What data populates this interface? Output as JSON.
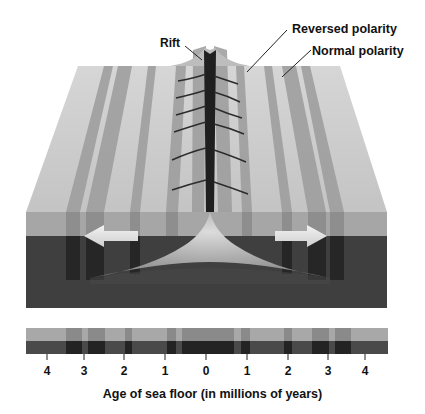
{
  "labels": {
    "rift": "Rift",
    "reversed": "Reversed polarity",
    "normal": "Normal polarity"
  },
  "axis": {
    "title": "Age of sea floor (in millions of years)",
    "ticks": [
      "4",
      "3",
      "2",
      "1",
      "0",
      "1",
      "2",
      "3",
      "4"
    ]
  },
  "colors": {
    "normal_top": "#c9c9c9",
    "reversed_top": "#9a9a9a",
    "normal_front": "#a7a7a7",
    "reversed_front": "#8c8c8c",
    "dark_base": "#3d3d3d",
    "darker_stripe": "#2a2a2a",
    "magma": "#b8b8b8",
    "arrow": "#e6e6e6"
  }
}
